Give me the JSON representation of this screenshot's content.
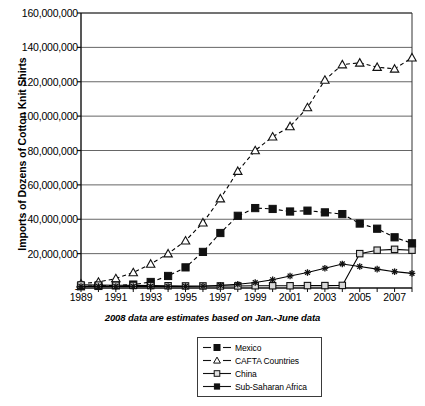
{
  "chart_data": {
    "type": "line",
    "title": "",
    "xlabel": "",
    "ylabel": "Imports of Dozens of Cotton Knit Shirts",
    "annotation": "2008 data are estimates based on Jan.-June data",
    "grid": true,
    "legend_position": "bottom-center",
    "xlim": [
      1989,
      2008
    ],
    "ylim": [
      0,
      160000000
    ],
    "ytick_labels": [
      "-",
      "20,000,000",
      "40,000,000",
      "60,000,000",
      "80,000,000",
      "100,000,000",
      "120,000,000",
      "140,000,000",
      "160,000,000"
    ],
    "ytick_values": [
      0,
      20000000,
      40000000,
      60000000,
      80000000,
      100000000,
      120000000,
      140000000,
      160000000
    ],
    "xtick_labels": [
      "1989",
      "1991",
      "1993",
      "1995",
      "1997",
      "1999",
      "2001",
      "2003",
      "2005",
      "2007"
    ],
    "xtick_values": [
      1989,
      1991,
      1993,
      1995,
      1997,
      1999,
      2001,
      2003,
      2005,
      2007
    ],
    "x": [
      1989,
      1990,
      1991,
      1992,
      1993,
      1994,
      1995,
      1996,
      1997,
      1998,
      1999,
      2000,
      2001,
      2002,
      2003,
      2004,
      2005,
      2006,
      2007,
      2008
    ],
    "series": [
      {
        "name": "Mexico",
        "marker": "filled-square",
        "line": "dashed",
        "color": "#000000",
        "values": [
          1000000,
          1200000,
          1500000,
          2000000,
          3500000,
          7000000,
          12000000,
          21000000,
          32000000,
          42000000,
          46500000,
          46000000,
          44500000,
          45000000,
          44000000,
          43000000,
          37500000,
          34500000,
          29500000,
          26000000
        ]
      },
      {
        "name": "CAFTA Countries",
        "marker": "open-triangle",
        "line": "dashed",
        "color": "#000000",
        "values": [
          2500000,
          3500000,
          5500000,
          9000000,
          14000000,
          20000000,
          27500000,
          38000000,
          52000000,
          68000000,
          80000000,
          88000000,
          94000000,
          105000000,
          121000000,
          130000000,
          131000000,
          128500000,
          127500000,
          134000000
        ]
      },
      {
        "name": "China",
        "marker": "open-square",
        "line": "solid",
        "color": "#000000",
        "values": [
          1800000,
          1700000,
          1600000,
          1500000,
          1400000,
          1300000,
          1200000,
          1200000,
          1200000,
          1200000,
          1300000,
          1300000,
          1300000,
          1400000,
          1400000,
          1500000,
          20000000,
          22000000,
          22500000,
          22000000
        ]
      },
      {
        "name": "Sub-Saharan Africa",
        "marker": "star",
        "line": "solid",
        "color": "#000000",
        "values": [
          900000,
          900000,
          900000,
          900000,
          900000,
          900000,
          900000,
          1000000,
          1500000,
          2200000,
          3200000,
          4800000,
          7000000,
          9000000,
          11500000,
          14000000,
          12500000,
          11000000,
          9500000,
          8500000
        ]
      }
    ]
  },
  "legend": {
    "items": [
      {
        "label": "Mexico"
      },
      {
        "label": "CAFTA Countries"
      },
      {
        "label": "China"
      },
      {
        "label": "Sub-Saharan Africa"
      }
    ]
  }
}
